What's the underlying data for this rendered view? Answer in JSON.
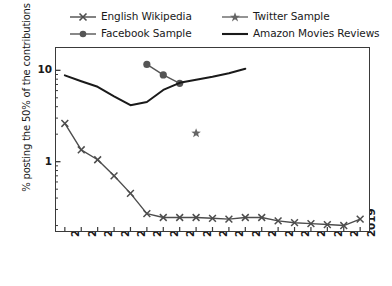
{
  "chart_data": {
    "type": "line",
    "title": "",
    "xlabel": "",
    "ylabel": "% posting the 50% of the contributions",
    "yscale": "log",
    "ylim": [
      0.17,
      18
    ],
    "xlim": [
      2000.4,
      2019.6
    ],
    "grid": false,
    "legend_position": "top",
    "yticks": [
      {
        "value": 10,
        "label": "10"
      },
      {
        "value": 1,
        "label": "1"
      }
    ],
    "x": [
      2001,
      2002,
      2003,
      2004,
      2005,
      2006,
      2007,
      2008,
      2009,
      2010,
      2011,
      2012,
      2013,
      2014,
      2015,
      2016,
      2017,
      2018,
      2019
    ],
    "xticklabels": [
      "2001",
      "2002",
      "2003",
      "2004",
      "2005",
      "2006",
      "2007",
      "2008",
      "2009",
      "2010",
      "2011",
      "2012",
      "2013",
      "2014",
      "2015",
      "2016",
      "2017",
      "2018",
      "2019"
    ],
    "series": [
      {
        "name": "English Wikipedia",
        "marker": "x",
        "linestyle": "solid",
        "color": "#4d4d4d",
        "x": [
          2001,
          2002,
          2003,
          2004,
          2005,
          2006,
          2007,
          2008,
          2009,
          2010,
          2011,
          2012,
          2013,
          2014,
          2015,
          2016,
          2017,
          2018,
          2019
        ],
        "values": [
          2.62,
          1.35,
          1.05,
          0.7,
          0.45,
          0.27,
          0.245,
          0.245,
          0.245,
          0.24,
          0.235,
          0.245,
          0.245,
          0.225,
          0.215,
          0.21,
          0.205,
          0.2,
          0.235
        ]
      },
      {
        "name": "Facebook Sample",
        "marker": "o",
        "linestyle": "solid",
        "color": "#555555",
        "x": [
          2006,
          2007,
          2008
        ],
        "values": [
          11.6,
          8.9,
          7.2
        ]
      },
      {
        "name": "Twitter Sample",
        "marker": "star",
        "linestyle": "solid",
        "color": "#666666",
        "x": [
          2009
        ],
        "values": [
          2.05
        ]
      },
      {
        "name": "Amazon Movies Reviews",
        "marker": "none",
        "linestyle": "solid",
        "color": "#1a1a1a",
        "x": [
          2001,
          2002,
          2003,
          2004,
          2005,
          2006,
          2007,
          2008,
          2009,
          2010,
          2011,
          2012
        ],
        "values": [
          8.8,
          7.6,
          6.6,
          5.2,
          4.15,
          4.5,
          6.1,
          7.3,
          7.9,
          8.5,
          9.3,
          10.4
        ]
      }
    ]
  },
  "legend": {
    "entries": [
      {
        "label": "English Wikipedia",
        "marker": "x",
        "color": "#4d4d4d"
      },
      {
        "label": "Twitter Sample",
        "marker": "star",
        "color": "#666666"
      },
      {
        "label": "Facebook Sample",
        "marker": "o",
        "color": "#555555"
      },
      {
        "label": "Amazon Movies Reviews",
        "marker": "none",
        "color": "#1a1a1a"
      }
    ]
  }
}
